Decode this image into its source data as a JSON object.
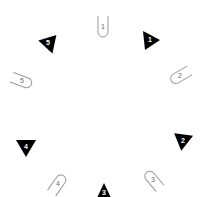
{
  "board": {
    "colors": {
      "background": "#ffffff",
      "triangle_fill": "#000000",
      "triangle_text": "#ffffff",
      "slot_stroke": "#9a9a9a",
      "slot_text": "#666666"
    },
    "triangles": [
      {
        "label": "1",
        "x": 150,
        "y": 40,
        "rotation": 0
      },
      {
        "label": "2",
        "x": 183,
        "y": 141,
        "rotation": 135
      },
      {
        "label": "3",
        "x": 104,
        "y": 193,
        "rotation": -90
      },
      {
        "label": "4",
        "x": 26,
        "y": 147,
        "rotation": 90
      },
      {
        "label": "5",
        "x": 48,
        "y": 43,
        "rotation": 200
      }
    ],
    "slots": [
      {
        "label": "1",
        "x": 103,
        "y": 27,
        "rotation": 0
      },
      {
        "label": "2",
        "x": 180,
        "y": 76,
        "rotation": 60
      },
      {
        "label": "3",
        "x": 153,
        "y": 180,
        "rotation": 140
      },
      {
        "label": "4",
        "x": 58,
        "y": 184,
        "rotation": 215
      },
      {
        "label": "5",
        "x": 22,
        "y": 81,
        "rotation": 290
      }
    ]
  }
}
